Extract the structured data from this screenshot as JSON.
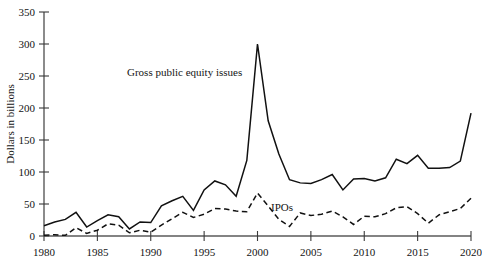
{
  "chart_data": {
    "type": "line",
    "title": "",
    "xlabel": "",
    "ylabel": "Dollars in billions",
    "xlim": [
      1980,
      2020
    ],
    "ylim": [
      0,
      350
    ],
    "grid": false,
    "legend_position": "inline-annotations",
    "x_tick_labels": [
      "1980",
      "1985",
      "1990",
      "1995",
      "2000",
      "2005",
      "2010",
      "2015",
      "2020"
    ],
    "x_ticks": [
      1980,
      1985,
      1990,
      1995,
      2000,
      2005,
      2010,
      2015,
      2020
    ],
    "y_tick_labels": [
      "0",
      "50",
      "100",
      "150",
      "200",
      "250",
      "300",
      "350"
    ],
    "y_ticks": [
      0,
      50,
      100,
      150,
      200,
      250,
      300,
      350
    ],
    "x": [
      1980,
      1981,
      1982,
      1983,
      1984,
      1985,
      1986,
      1987,
      1988,
      1989,
      1990,
      1991,
      1992,
      1993,
      1994,
      1995,
      1996,
      1997,
      1998,
      1999,
      2000,
      2001,
      2002,
      2003,
      2004,
      2005,
      2006,
      2007,
      2008,
      2009,
      2010,
      2011,
      2012,
      2013,
      2014,
      2015,
      2016,
      2017,
      2018,
      2019,
      2020
    ],
    "series": [
      {
        "name": "Gross public equity issues",
        "style": "solid",
        "annotation": "Gross public equity issues",
        "values": [
          16,
          22,
          26,
          37,
          14,
          24,
          33,
          30,
          11,
          22,
          21,
          47,
          55,
          62,
          40,
          72,
          86,
          80,
          62,
          118,
          300,
          180,
          128,
          88,
          83,
          82,
          88,
          96,
          72,
          89,
          90,
          86,
          91,
          120,
          113,
          126,
          106,
          106,
          107,
          117,
          192
        ]
      },
      {
        "name": "IPOs",
        "style": "dashed",
        "annotation": "IPOs",
        "values": [
          1,
          2,
          1,
          13,
          4,
          9,
          19,
          17,
          5,
          9,
          6,
          17,
          27,
          37,
          29,
          34,
          43,
          42,
          39,
          38,
          67,
          47,
          26,
          15,
          36,
          32,
          34,
          39,
          30,
          18,
          31,
          30,
          35,
          44,
          46,
          35,
          20,
          33,
          38,
          43,
          59
        ]
      }
    ]
  },
  "axis": {
    "y_title": "Dollars in billions"
  },
  "annotations": {
    "gross_label": "Gross public equity issues",
    "ipos_label": "IPOs"
  }
}
